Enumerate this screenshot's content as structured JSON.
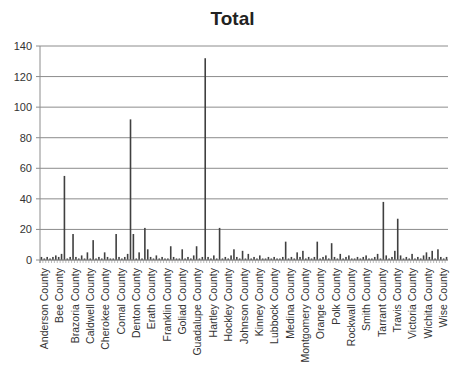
{
  "chart_data": {
    "type": "bar",
    "title": "Total",
    "xlabel": "",
    "ylabel": "",
    "ylim": [
      0,
      140
    ],
    "yticks": [
      0,
      20,
      40,
      60,
      80,
      100,
      120,
      140
    ],
    "grid": true,
    "legend": "none",
    "labeled_categories": [
      "Anderson County",
      "Bee County",
      "Brazoria County",
      "Caldwell County",
      "Cherokee County",
      "Comal County",
      "Denton County",
      "Erath County",
      "Franklin County",
      "Goliad County",
      "Guadalupe County",
      "Hartley County",
      "Hockley County",
      "Johnson County",
      "Kinney County",
      "Lubbock County",
      "Medina County",
      "Montgomery County",
      "Orange County",
      "Polk County",
      "Rockwall County",
      "Smith County",
      "Tarrant County",
      "Travis County",
      "Victoria County",
      "Wichita County",
      "Wise County"
    ],
    "label_every": 6,
    "bar_color": "#404040",
    "values": [
      2,
      1,
      2,
      1,
      2,
      3,
      2,
      4,
      55,
      1,
      2,
      17,
      2,
      1,
      3,
      1,
      5,
      1,
      13,
      1,
      2,
      1,
      5,
      2,
      1,
      1,
      17,
      2,
      1,
      2,
      4,
      92,
      17,
      1,
      5,
      1,
      21,
      7,
      2,
      1,
      3,
      1,
      2,
      1,
      1,
      9,
      2,
      1,
      1,
      7,
      1,
      2,
      1,
      3,
      9,
      1,
      2,
      132,
      2,
      1,
      3,
      1,
      21,
      1,
      2,
      1,
      3,
      7,
      2,
      1,
      6,
      1,
      4,
      1,
      2,
      1,
      3,
      1,
      1,
      2,
      1,
      2,
      1,
      1,
      2,
      12,
      1,
      2,
      1,
      5,
      2,
      6,
      1,
      2,
      1,
      2,
      12,
      1,
      2,
      3,
      1,
      11,
      2,
      1,
      4,
      1,
      2,
      3,
      1,
      1,
      2,
      1,
      2,
      3,
      1,
      1,
      2,
      4,
      1,
      38,
      3,
      1,
      2,
      6,
      27,
      3,
      1,
      2,
      1,
      4,
      1,
      2,
      1,
      3,
      5,
      2,
      6,
      1,
      7,
      2,
      1,
      2
    ]
  }
}
